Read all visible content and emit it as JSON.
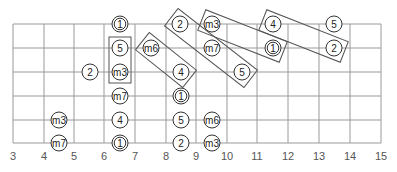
{
  "diagram": {
    "type": "guitar-fretboard-scale-diagram",
    "colors": {
      "grid": "#9a9a9a",
      "label": "#555555",
      "note_stroke": "#333333",
      "box_stroke": "#555555",
      "background": "#ffffff"
    },
    "geometry": {
      "fret_x": [
        13,
        44,
        74,
        104,
        135,
        166,
        196,
        227,
        257,
        288,
        319,
        350,
        381
      ],
      "string_y": [
        24,
        48,
        72,
        96,
        120,
        143
      ],
      "label_y": 160,
      "note_radius": 8
    },
    "fret_labels": [
      "3",
      "4",
      "5",
      "6",
      "7",
      "8",
      "9",
      "10",
      "11",
      "12",
      "13",
      "14",
      "15"
    ],
    "notes": [
      {
        "label": "1",
        "x": 120,
        "y": 24,
        "root": true
      },
      {
        "label": "2",
        "x": 180,
        "y": 24,
        "root": false
      },
      {
        "label": "m3",
        "x": 212,
        "y": 24,
        "root": false
      },
      {
        "label": "4",
        "x": 273,
        "y": 24,
        "root": false
      },
      {
        "label": "5",
        "x": 334,
        "y": 24,
        "root": false
      },
      {
        "label": "5",
        "x": 120,
        "y": 48,
        "root": false
      },
      {
        "label": "m6",
        "x": 151,
        "y": 48,
        "root": false
      },
      {
        "label": "m7",
        "x": 212,
        "y": 48,
        "root": false
      },
      {
        "label": "1",
        "x": 273,
        "y": 48,
        "root": true
      },
      {
        "label": "2",
        "x": 334,
        "y": 48,
        "root": false
      },
      {
        "label": "2",
        "x": 90,
        "y": 72,
        "root": false
      },
      {
        "label": "m3",
        "x": 120,
        "y": 72,
        "root": false
      },
      {
        "label": "4",
        "x": 181,
        "y": 72,
        "root": false
      },
      {
        "label": "5",
        "x": 242,
        "y": 72,
        "root": false
      },
      {
        "label": "m7",
        "x": 120,
        "y": 96,
        "root": false
      },
      {
        "label": "1",
        "x": 181,
        "y": 96,
        "root": true
      },
      {
        "label": "m3",
        "x": 59,
        "y": 120,
        "root": false
      },
      {
        "label": "4",
        "x": 120,
        "y": 120,
        "root": false
      },
      {
        "label": "5",
        "x": 181,
        "y": 120,
        "root": false
      },
      {
        "label": "m6",
        "x": 212,
        "y": 120,
        "root": false
      },
      {
        "label": "m7",
        "x": 59,
        "y": 143,
        "root": false
      },
      {
        "label": "1",
        "x": 120,
        "y": 143,
        "root": true
      },
      {
        "label": "2",
        "x": 181,
        "y": 143,
        "root": false
      },
      {
        "label": "m3",
        "x": 212,
        "y": 143,
        "root": false
      }
    ],
    "pattern_boxes": [
      {
        "name": "box-5-m3",
        "from": [
          120,
          48
        ],
        "to": [
          120,
          72
        ],
        "width": 22
      },
      {
        "name": "box-m6-4",
        "from": [
          151,
          48
        ],
        "to": [
          181,
          72
        ],
        "width": 22
      },
      {
        "name": "box-2-m7-5",
        "from": [
          180,
          24
        ],
        "to": [
          242,
          72
        ],
        "width": 22
      },
      {
        "name": "box-m3-1",
        "from": [
          212,
          24
        ],
        "to": [
          273,
          48
        ],
        "width": 22
      },
      {
        "name": "box-4-2",
        "from": [
          273,
          24
        ],
        "to": [
          334,
          48
        ],
        "width": 22
      }
    ]
  }
}
